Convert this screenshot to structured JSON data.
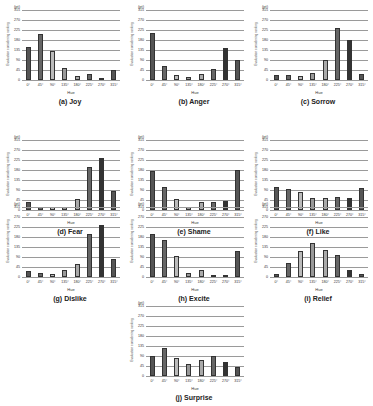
{
  "figure": {
    "unit_label": "(pt)",
    "y_axis_label": "Evaluation considering ranking",
    "x_axis_label": "Hue",
    "y_ticks": [
      "0",
      "45",
      "90",
      "135",
      "180",
      "225",
      "270",
      "315"
    ],
    "x_ticks": [
      "0°",
      "45°",
      "90°",
      "135°",
      "180°",
      "225°",
      "270°",
      "315°"
    ],
    "bar_colors": [
      "#555555",
      "#666666",
      "#bbbbbb",
      "#999999",
      "#aaaaaa",
      "#666666",
      "#333333",
      "#555555"
    ]
  },
  "chart_data": [
    {
      "type": "bar",
      "title": "(a) Joy",
      "categories": [
        "0°",
        "45°",
        "90°",
        "135°",
        "180°",
        "225°",
        "270°",
        "315°"
      ],
      "values": [
        150,
        205,
        130,
        55,
        20,
        25,
        8,
        45
      ],
      "xlabel": "Hue",
      "ylabel": "Evaluation considering ranking",
      "unit": "(pt)",
      "ylim": [
        0,
        315
      ],
      "grid": true
    },
    {
      "type": "bar",
      "title": "(b) Anger",
      "categories": [
        "0°",
        "45°",
        "90°",
        "135°",
        "180°",
        "225°",
        "270°",
        "315°"
      ],
      "values": [
        210,
        65,
        22,
        15,
        28,
        50,
        145,
        90
      ],
      "xlabel": "Hue",
      "ylabel": "Evaluation considering ranking",
      "unit": "(pt)",
      "ylim": [
        0,
        315
      ],
      "grid": true
    },
    {
      "type": "bar",
      "title": "(c) Sorrow",
      "categories": [
        "0°",
        "45°",
        "90°",
        "135°",
        "180°",
        "225°",
        "270°",
        "315°"
      ],
      "values": [
        22,
        22,
        18,
        32,
        90,
        235,
        180,
        28
      ],
      "xlabel": "Hue",
      "ylabel": "Evaluation considering ranking",
      "unit": "(pt)",
      "ylim": [
        0,
        315
      ],
      "grid": true
    },
    {
      "type": "bar",
      "title": "(d) Fear",
      "categories": [
        "0°",
        "45°",
        "90°",
        "135°",
        "180°",
        "225°",
        "270°",
        "315°"
      ],
      "values": [
        35,
        15,
        15,
        15,
        48,
        195,
        235,
        85
      ],
      "xlabel": "Hue",
      "ylabel": "Evaluation considering ranking",
      "unit": "(pt)",
      "ylim": [
        0,
        315
      ],
      "grid": true
    },
    {
      "type": "bar",
      "title": "(e) Shame",
      "categories": [
        "0°",
        "45°",
        "90°",
        "135°",
        "180°",
        "225°",
        "270°",
        "315°"
      ],
      "values": [
        175,
        105,
        50,
        15,
        35,
        35,
        42,
        180
      ],
      "xlabel": "Hue",
      "ylabel": "Evaluation considering ranking",
      "unit": "(pt)",
      "ylim": [
        0,
        315
      ],
      "grid": true
    },
    {
      "type": "bar",
      "title": "(f) Like",
      "categories": [
        "0°",
        "45°",
        "90°",
        "135°",
        "180°",
        "225°",
        "270°",
        "315°"
      ],
      "values": [
        105,
        95,
        80,
        55,
        55,
        58,
        52,
        100
      ],
      "xlabel": "Hue",
      "ylabel": "Evaluation considering ranking",
      "unit": "(pt)",
      "ylim": [
        0,
        315
      ],
      "grid": true
    },
    {
      "type": "bar",
      "title": "(g) Dislike",
      "categories": [
        "0°",
        "45°",
        "90°",
        "135°",
        "180°",
        "225°",
        "270°",
        "315°"
      ],
      "values": [
        25,
        18,
        12,
        30,
        60,
        195,
        235,
        80
      ],
      "xlabel": "Hue",
      "ylabel": "Evaluation considering ranking",
      "unit": "(pt)",
      "ylim": [
        0,
        315
      ],
      "grid": true
    },
    {
      "type": "bar",
      "title": "(h) Excite",
      "categories": [
        "0°",
        "45°",
        "90°",
        "135°",
        "180°",
        "225°",
        "270°",
        "315°"
      ],
      "values": [
        195,
        165,
        95,
        20,
        32,
        10,
        8,
        115
      ],
      "xlabel": "Hue",
      "ylabel": "Evaluation considering ranking",
      "unit": "(pt)",
      "ylim": [
        0,
        315
      ],
      "grid": true
    },
    {
      "type": "bar",
      "title": "(i) Relief",
      "categories": [
        "0°",
        "45°",
        "90°",
        "135°",
        "180°",
        "225°",
        "270°",
        "315°"
      ],
      "values": [
        15,
        65,
        115,
        155,
        120,
        100,
        32,
        12
      ],
      "xlabel": "Hue",
      "ylabel": "Evaluation considering ranking",
      "unit": "(pt)",
      "ylim": [
        0,
        315
      ],
      "grid": true
    },
    {
      "type": "bar",
      "title": "(j) Surprise",
      "categories": [
        "0°",
        "45°",
        "90°",
        "135°",
        "180°",
        "225°",
        "270°",
        "315°"
      ],
      "values": [
        90,
        125,
        80,
        55,
        70,
        88,
        62,
        40
      ],
      "xlabel": "Hue",
      "ylabel": "Evaluation considering ranking",
      "unit": "(pt)",
      "ylim": [
        0,
        315
      ],
      "grid": true
    }
  ]
}
